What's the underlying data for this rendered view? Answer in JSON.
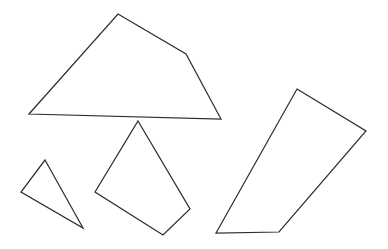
{
  "figure": {
    "background_color": "#ffffff",
    "stroke_color": "#2e2e2e",
    "fill_color": "#ffffff",
    "stroke_width": 1.25,
    "width": 388,
    "height": 249,
    "shape_count": 4
  },
  "shapes": [
    {
      "id": "large-quadrilateral",
      "label": "Large quadrilateral",
      "sides": 4,
      "points": "29,114 118,14 186,54 221,119",
      "closed": true
    },
    {
      "id": "middle-quadrilateral",
      "label": "Middle quadrilateral",
      "sides": 4,
      "points": "138,121 190,209 163,235 95,192",
      "closed": true
    },
    {
      "id": "small-triangle",
      "label": "Small triangle",
      "sides": 3,
      "points": "45,160 83,228 21,192",
      "closed": true
    },
    {
      "id": "right-quadrilateral",
      "label": "Right quadrilateral",
      "sides": 4,
      "points": "297,89 366,131 279,232 216,233",
      "closed": true
    }
  ],
  "chart_data": {
    "type": "scatter",
    "xlabel": "",
    "ylabel": "",
    "xlim": [
      0,
      388
    ],
    "ylim": [
      249,
      0
    ],
    "grid": false,
    "legend": null,
    "series": [
      {
        "name": "Large quadrilateral",
        "x": [
          29,
          118,
          186,
          221
        ],
        "y": [
          114,
          14,
          54,
          119
        ]
      },
      {
        "name": "Middle quadrilateral",
        "x": [
          138,
          190,
          163,
          95
        ],
        "y": [
          121,
          209,
          235,
          192
        ]
      },
      {
        "name": "Small triangle",
        "x": [
          45,
          83,
          21
        ],
        "y": [
          160,
          228,
          192
        ]
      },
      {
        "name": "Right quadrilateral",
        "x": [
          297,
          366,
          279,
          216
        ],
        "y": [
          89,
          131,
          232,
          233
        ]
      }
    ]
  }
}
